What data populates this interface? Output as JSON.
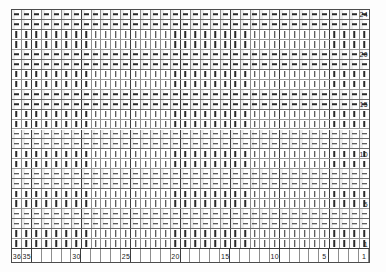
{
  "chart_data": {
    "type": "table",
    "title": "",
    "xlabel": "",
    "ylabel": "",
    "grid": true,
    "legend": "none",
    "orientation": "descending-both-axes",
    "x_axis": {
      "position": "bottom",
      "direction": "descending",
      "range": [
        36,
        1
      ],
      "columns": 36,
      "tick_labels": [
        "36",
        "35",
        "30",
        "25",
        "20",
        "15",
        "10",
        "5",
        "1"
      ],
      "tick_values": [
        36,
        35,
        30,
        25,
        20,
        15,
        10,
        5,
        1
      ]
    },
    "y_axis": {
      "position": "right",
      "direction": "descending",
      "range": [
        24,
        1
      ],
      "rows": 24,
      "tick_labels": [
        "24",
        "20",
        "15",
        "10",
        "5",
        "1"
      ],
      "tick_values": [
        24,
        20,
        15,
        10,
        5,
        1
      ]
    },
    "cell_marks": {
      "dash": "horizontal-dash",
      "tick": "vertical-tick",
      "pattern": "two-dash-rows-then-two-tick-rows-repeating"
    },
    "row_marks": [
      "dash",
      "dash",
      "tick",
      "tick",
      "dash",
      "dash",
      "tick",
      "tick",
      "dash",
      "dash",
      "tick",
      "tick",
      "dash",
      "dash",
      "tick",
      "tick",
      "dash",
      "dash",
      "tick",
      "tick",
      "dash",
      "dash",
      "tick",
      "tick"
    ]
  },
  "colors": {
    "background": "#ffffff",
    "frame": "#4c4c4c",
    "major_line": "#3d3d3d",
    "minor_line": "#8d8d8d",
    "mark": "#2a2a2a",
    "shade": "#ebebeb",
    "label": "#1a1a1a"
  }
}
